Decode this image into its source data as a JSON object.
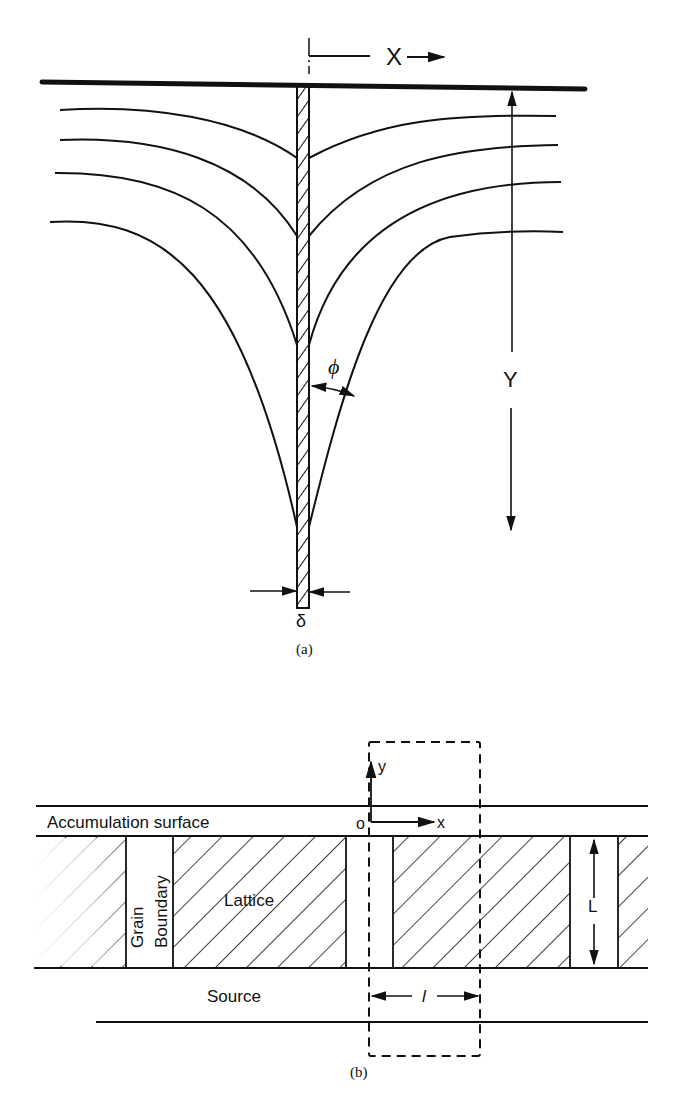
{
  "figure_a": {
    "caption": "(a)",
    "labels": {
      "x_axis": "X",
      "y_axis": "Y",
      "angle": "ϕ",
      "width": "δ"
    },
    "contour_count": 4
  },
  "figure_b": {
    "caption": "(b)",
    "labels": {
      "accumulation_surface": "Accumulation surface",
      "grain": "Grain",
      "boundary": "Boundary",
      "lattice": "Lattice",
      "source": "Source",
      "origin": "o",
      "x_axis": "x",
      "y_axis": "y",
      "thickness": "L",
      "period": "l"
    }
  },
  "colors": {
    "ink": "#111111",
    "paper": "#ffffff"
  }
}
